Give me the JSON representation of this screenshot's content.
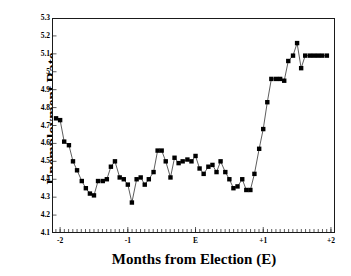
{
  "chart_data": {
    "type": "line",
    "title": "",
    "xlabel": "Months from Election (E)",
    "ylabel": "Unemployment Rate",
    "xlim": [
      -2.12,
      2.06
    ],
    "ylim": [
      4.1,
      5.3
    ],
    "grid": false,
    "legend": null,
    "marker": "square",
    "marker_color": "#000000",
    "line_color": "#333333",
    "xtick_labels": [
      "-2",
      "-1",
      "E",
      "+1",
      "+2"
    ],
    "xtick_values": [
      -2,
      -1,
      0,
      1,
      2
    ],
    "xminor_step": 0.0625,
    "ytick_labels": [
      "4.1",
      "4.2",
      "4.3",
      "4.4",
      "4.5",
      "4.6",
      "4.7",
      "4.8",
      "4.9",
      "5",
      "5.1",
      "5.2",
      "5.3"
    ],
    "ytick_values": [
      4.1,
      4.2,
      4.3,
      4.4,
      4.5,
      4.6,
      4.7,
      4.8,
      4.9,
      5.0,
      5.1,
      5.2,
      5.3
    ],
    "x": [
      -2.06,
      -2.0,
      -1.94,
      -1.87,
      -1.81,
      -1.75,
      -1.68,
      -1.62,
      -1.56,
      -1.5,
      -1.44,
      -1.37,
      -1.31,
      -1.25,
      -1.19,
      -1.12,
      -1.06,
      -1.0,
      -0.94,
      -0.87,
      -0.81,
      -0.75,
      -0.69,
      -0.62,
      -0.56,
      -0.5,
      -0.44,
      -0.37,
      -0.31,
      -0.25,
      -0.19,
      -0.12,
      -0.06,
      0.0,
      0.06,
      0.12,
      0.19,
      0.25,
      0.31,
      0.37,
      0.44,
      0.5,
      0.56,
      0.62,
      0.69,
      0.75,
      0.81,
      0.87,
      0.94,
      1.0,
      1.06,
      1.12,
      1.19,
      1.25,
      1.31,
      1.37,
      1.44,
      1.5,
      1.56,
      1.62,
      1.69,
      1.75,
      1.81,
      1.87,
      1.94
    ],
    "values": [
      4.74,
      4.73,
      4.61,
      4.59,
      4.5,
      4.45,
      4.39,
      4.35,
      4.32,
      4.31,
      4.39,
      4.39,
      4.4,
      4.47,
      4.5,
      4.41,
      4.4,
      4.37,
      4.27,
      4.4,
      4.41,
      4.37,
      4.4,
      4.44,
      4.56,
      4.56,
      4.5,
      4.41,
      4.52,
      4.49,
      4.5,
      4.51,
      4.5,
      4.53,
      4.46,
      4.43,
      4.47,
      4.48,
      4.44,
      4.5,
      4.44,
      4.4,
      4.35,
      4.36,
      4.4,
      4.34,
      4.34,
      4.43,
      4.57,
      4.68,
      4.83,
      4.96,
      4.96,
      4.96,
      4.95,
      5.06,
      5.09,
      5.16,
      5.02,
      5.09,
      5.09,
      5.09,
      5.09,
      5.09,
      5.09
    ]
  }
}
